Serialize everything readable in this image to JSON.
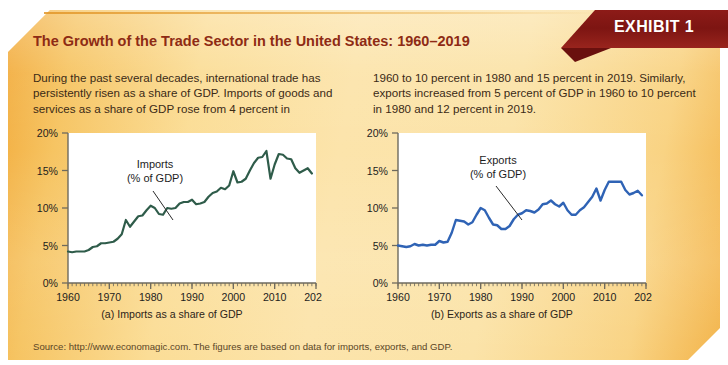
{
  "exhibit": {
    "badge_label": "EXHIBIT 1",
    "title": "The Growth of the Trade Sector in the United States: 1960–2019",
    "blurb_left": "During the past several decades, international trade has persistently risen as a share of GDP. Imports of goods and services as a share of GDP rose from 4 percent in",
    "blurb_right": "1960 to 10 percent in 1980 and 15 percent in 2019. Similarly, exports increased from 5 percent of GDP in 1960 to 10 percent in 1980 and 12 percent in 2019.",
    "source": "Source: http://www.economagic.com. The figures are based on data for imports, exports, and GDP.",
    "colors": {
      "badge_bg": "#7d1512",
      "title_text": "#8e2b14",
      "panel_gradient_start": "#f2ab3c",
      "panel_gradient_mid": "#fce4ab",
      "imports_line": "#2f5c4a",
      "exports_line": "#2f63b5",
      "plot_bg": "#ffffff",
      "axis": "#6e6a5e"
    }
  },
  "chart_data": [
    {
      "type": "line",
      "id": "imports",
      "title": "",
      "caption": "(a) Imports as a share of GDP",
      "series_label": "Imports\n(% of GDP)",
      "series_label_line1": "Imports",
      "series_label_line2": "(% of GDP)",
      "xlabel": "",
      "ylabel": "",
      "xlim": [
        1960,
        2020
      ],
      "ylim": [
        0,
        20
      ],
      "xticks": [
        1960,
        1970,
        1980,
        1990,
        2000,
        2010,
        2020
      ],
      "xticklabels": [
        "1960",
        "1970",
        "1980",
        "1990",
        "2000",
        "2010",
        "2020"
      ],
      "yticks": [
        0,
        5,
        10,
        15,
        20
      ],
      "yticklabels": [
        "0%",
        "5%",
        "10%",
        "15%",
        "20%"
      ],
      "minor_xtick_interval": 1,
      "grid": false,
      "legend": "none",
      "line_color": "#2f5c4a",
      "x": [
        1960,
        1961,
        1962,
        1963,
        1964,
        1965,
        1966,
        1967,
        1968,
        1969,
        1970,
        1971,
        1972,
        1973,
        1974,
        1975,
        1976,
        1977,
        1978,
        1979,
        1980,
        1981,
        1982,
        1983,
        1984,
        1985,
        1986,
        1987,
        1988,
        1989,
        1990,
        1991,
        1992,
        1993,
        1994,
        1995,
        1996,
        1997,
        1998,
        1999,
        2000,
        2001,
        2002,
        2003,
        2004,
        2005,
        2006,
        2007,
        2008,
        2009,
        2010,
        2011,
        2012,
        2013,
        2014,
        2015,
        2016,
        2017,
        2018,
        2019
      ],
      "values": [
        4.2,
        4.1,
        4.2,
        4.2,
        4.2,
        4.4,
        4.8,
        4.9,
        5.3,
        5.3,
        5.4,
        5.5,
        5.9,
        6.5,
        8.4,
        7.5,
        8.2,
        8.9,
        9.0,
        9.7,
        10.3,
        10.0,
        9.2,
        9.1,
        10.0,
        9.9,
        10.0,
        10.6,
        10.8,
        10.8,
        11.1,
        10.5,
        10.6,
        10.8,
        11.5,
        12.0,
        12.2,
        12.7,
        12.5,
        13.0,
        14.9,
        13.4,
        13.5,
        13.9,
        15.0,
        16.0,
        16.7,
        16.8,
        17.6,
        13.9,
        15.8,
        17.2,
        17.1,
        16.6,
        16.5,
        15.3,
        14.7,
        15.0,
        15.3,
        14.6
      ]
    },
    {
      "type": "line",
      "id": "exports",
      "title": "",
      "caption": "(b) Exports as a share of GDP",
      "series_label": "Exports\n(% of GDP)",
      "series_label_line1": "Exports",
      "series_label_line2": "(% of GDP)",
      "xlabel": "",
      "ylabel": "",
      "xlim": [
        1960,
        2020
      ],
      "ylim": [
        0,
        20
      ],
      "xticks": [
        1960,
        1970,
        1980,
        1990,
        2000,
        2010,
        2020
      ],
      "xticklabels": [
        "1960",
        "1970",
        "1980",
        "1990",
        "2000",
        "2010",
        "2020"
      ],
      "yticks": [
        0,
        5,
        10,
        15,
        20
      ],
      "yticklabels": [
        "0%",
        "5%",
        "10%",
        "15%",
        "20%"
      ],
      "minor_xtick_interval": 1,
      "grid": false,
      "legend": "none",
      "line_color": "#2f63b5",
      "x": [
        1960,
        1961,
        1962,
        1963,
        1964,
        1965,
        1966,
        1967,
        1968,
        1969,
        1970,
        1971,
        1972,
        1973,
        1974,
        1975,
        1976,
        1977,
        1978,
        1979,
        1980,
        1981,
        1982,
        1983,
        1984,
        1985,
        1986,
        1987,
        1988,
        1989,
        1990,
        1991,
        1992,
        1993,
        1994,
        1995,
        1996,
        1997,
        1998,
        1999,
        2000,
        2001,
        2002,
        2003,
        2004,
        2005,
        2006,
        2007,
        2008,
        2009,
        2010,
        2011,
        2012,
        2013,
        2014,
        2015,
        2016,
        2017,
        2018,
        2019
      ],
      "values": [
        5.0,
        4.9,
        4.8,
        4.9,
        5.2,
        5.0,
        5.1,
        5.0,
        5.1,
        5.1,
        5.6,
        5.4,
        5.5,
        6.7,
        8.4,
        8.3,
        8.2,
        7.8,
        8.1,
        9.1,
        10.0,
        9.7,
        8.7,
        7.8,
        7.7,
        7.2,
        7.2,
        7.6,
        8.5,
        9.1,
        9.3,
        9.7,
        9.6,
        9.4,
        9.8,
        10.5,
        10.6,
        11.0,
        10.5,
        10.2,
        10.7,
        9.7,
        9.1,
        9.1,
        9.7,
        10.1,
        10.8,
        11.5,
        12.6,
        11.0,
        12.4,
        13.5,
        13.5,
        13.5,
        13.5,
        12.4,
        11.8,
        12.0,
        12.3,
        11.7
      ]
    }
  ]
}
